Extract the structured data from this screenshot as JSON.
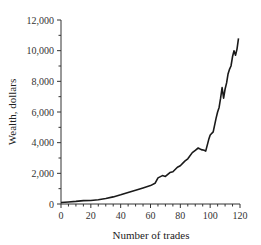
{
  "chart_data": {
    "type": "line",
    "title": "",
    "xlabel": "Number of trades",
    "ylabel": "Wealth, dollars",
    "xlim": [
      0,
      120
    ],
    "ylim": [
      0,
      12000
    ],
    "x_ticks": [
      0,
      20,
      40,
      60,
      80,
      100,
      120
    ],
    "x_tick_labels": [
      "0",
      "20",
      "40",
      "60",
      "80",
      "100",
      "120"
    ],
    "y_ticks": [
      0,
      2000,
      4000,
      6000,
      8000,
      10000,
      12000
    ],
    "y_tick_labels": [
      "0",
      "2,000",
      "4,000",
      "6,000",
      "8,000",
      "10,000",
      "12,000"
    ],
    "grid": false,
    "legend": null,
    "series": [
      {
        "name": "Wealth",
        "color": "#1a1a1a",
        "x": [
          0,
          5,
          10,
          15,
          20,
          25,
          30,
          35,
          40,
          45,
          50,
          55,
          60,
          63,
          65,
          68,
          70,
          73,
          75,
          78,
          80,
          83,
          85,
          88,
          90,
          92,
          94,
          96,
          97,
          99,
          100,
          102,
          104,
          105,
          106,
          107,
          108,
          109,
          110,
          111,
          112,
          113,
          114,
          115,
          116,
          117,
          118,
          119
        ],
        "y": [
          100,
          130,
          170,
          220,
          230,
          280,
          360,
          460,
          600,
          750,
          900,
          1050,
          1200,
          1350,
          1700,
          1850,
          1800,
          2050,
          2100,
          2400,
          2500,
          2800,
          2950,
          3350,
          3500,
          3650,
          3550,
          3500,
          3450,
          4200,
          4500,
          4700,
          5600,
          6000,
          6300,
          6900,
          7600,
          6900,
          7500,
          7900,
          8500,
          8800,
          9000,
          9600,
          10000,
          9700,
          10100,
          10800
        ]
      }
    ]
  }
}
